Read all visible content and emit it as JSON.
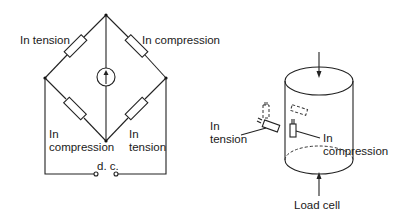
{
  "bridge": {
    "labels": {
      "top_left": "In tension",
      "top_right": "In compression",
      "bottom_left_line1": "In",
      "bottom_left_line2": "compression",
      "bottom_right_line1": "In",
      "bottom_right_line2": "tension",
      "supply": "d. c."
    },
    "meter_icon": "galvanometer-arrow-up"
  },
  "load_cell": {
    "labels": {
      "tension_line1": "In",
      "tension_line2": "tension",
      "compression_line1": "In",
      "compression_line2": "compression",
      "caption": "Load cell"
    }
  },
  "colors": {
    "line": "#222222",
    "text": "#1a1a1a",
    "background": "#ffffff"
  }
}
